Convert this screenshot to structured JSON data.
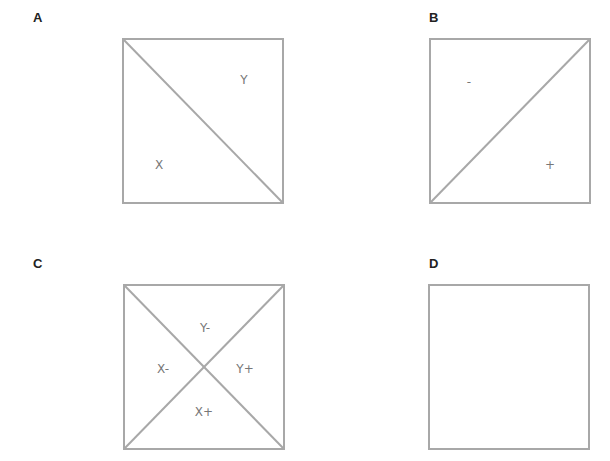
{
  "figure": {
    "panels": [
      {
        "id": "A",
        "label": "A",
        "diagonals": [
          "top-left-to-bottom-right"
        ],
        "regions": [
          {
            "label": "Y",
            "position": "upper-right"
          },
          {
            "label": "X",
            "position": "lower-left"
          }
        ]
      },
      {
        "id": "B",
        "label": "B",
        "diagonals": [
          "bottom-left-to-top-right"
        ],
        "regions": [
          {
            "label": "-",
            "position": "upper-left"
          },
          {
            "label": "+",
            "position": "lower-right"
          }
        ]
      },
      {
        "id": "C",
        "label": "C",
        "diagonals": [
          "top-left-to-bottom-right",
          "bottom-left-to-top-right"
        ],
        "regions": [
          {
            "label": "Y-",
            "position": "top"
          },
          {
            "label": "X-",
            "position": "left"
          },
          {
            "label": "Y+",
            "position": "right"
          },
          {
            "label": "X+",
            "position": "bottom"
          }
        ]
      },
      {
        "id": "D",
        "label": "D",
        "diagonals": [],
        "regions": []
      }
    ],
    "colors": {
      "stroke": "#a8a8a8",
      "panel_label": "#222222",
      "region_label": "#777777",
      "background": "#ffffff"
    }
  }
}
